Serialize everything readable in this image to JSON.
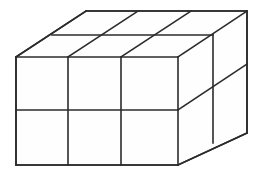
{
  "figure": {
    "type": "isometric-cube-stack",
    "counts": {
      "columns_wide": 3,
      "rows_tall": 2,
      "layers_deep": 2,
      "total_cubes": 12
    },
    "style": {
      "stroke_color": "#2b2b2b",
      "fill_color": "#ffffff",
      "background_color": "#ffffff",
      "stroke_width": 1.6
    },
    "geometry": {
      "front_face": {
        "top_left": [
          16,
          57
        ],
        "top_right": [
          178,
          57
        ],
        "bottom_right": [
          178,
          165
        ],
        "bottom_left": [
          16,
          165
        ]
      },
      "depth_offset": [
        69,
        -46
      ],
      "front_vertical_x": [
        16,
        68,
        121,
        178
      ],
      "front_horizontal_y": [
        57,
        110,
        165
      ],
      "top_back_left": [
        86,
        11
      ],
      "top_back_right": [
        247,
        11
      ],
      "right_back_bottom": [
        247,
        133
      ],
      "top_mid_depth_line_y": 35,
      "right_mid_depth_x": 213
    },
    "paths": {
      "outline": "M16,57 L86,11 L247,11 L247,133 L178,165 L16,165 Z",
      "front_face": "M16,57 L178,57 L178,165 L16,165 Z",
      "top_face": "M16,57 L86,11 L247,11 L178,57 Z",
      "right_face": "M178,57 L247,11 L247,133 L178,165 Z",
      "front_vertical_1": "M68,57 L68,165",
      "front_vertical_2": "M121,57 L121,165",
      "front_horizontal_mid": "M16,110 L178,110",
      "front_edge_top": "M16,57 L178,57",
      "front_edge_bottom": "M16,165 L178,165",
      "front_edge_left": "M16,57 L16,165",
      "front_edge_right": "M178,57 L178,165",
      "top_diag_left": "M16,57 L86,11",
      "top_diag_a": "M68,57 L138,11",
      "top_diag_b": "M121,57 L191,11",
      "top_diag_right": "M178,57 L247,11",
      "top_back_edge": "M86,11 L247,11",
      "top_mid_depth": "M52,35 L213,35",
      "right_vertical_mid": "M213,35 L213,143",
      "right_back_vertical": "M247,11 L247,133",
      "right_diag_mid": "M178,110 L247,64",
      "right_diag_bottom": "M178,165 L247,133"
    }
  }
}
